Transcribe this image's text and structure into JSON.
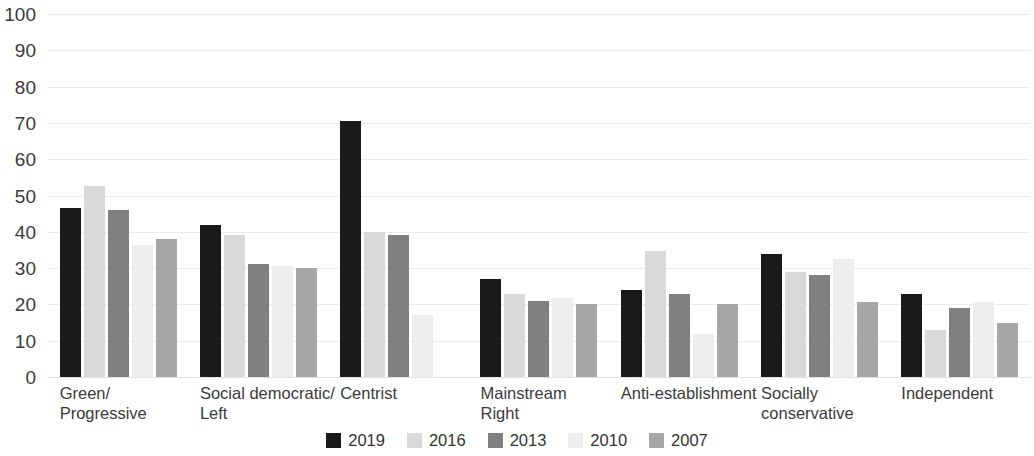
{
  "chart_data": {
    "type": "bar",
    "title": "",
    "subtitle": "",
    "xlabel": "",
    "ylabel": "",
    "ylim": [
      0,
      100
    ],
    "ytick_step": 10,
    "yticks": [
      "100",
      "90",
      "80",
      "70",
      "60",
      "50",
      "40",
      "30",
      "20",
      "10",
      "0"
    ],
    "grid": true,
    "legend_position": "bottom",
    "categories": [
      "Green/\nProgressive",
      "Social democratic/\nLeft",
      "Centrist",
      "Mainstream\nRight",
      "Anti-establishment",
      "Socially\nconservative",
      "Independent"
    ],
    "series": [
      {
        "name": "2019",
        "color": "#1a1a1a",
        "values": [
          46.5,
          42.0,
          70.5,
          27.0,
          24.0,
          33.8,
          23.0
        ]
      },
      {
        "name": "2016",
        "color": "#d9d9d9",
        "values": [
          52.5,
          39.0,
          40.0,
          23.0,
          34.8,
          29.0,
          13.0
        ]
      },
      {
        "name": "2013",
        "color": "#808080",
        "values": [
          46.0,
          31.0,
          39.0,
          21.0,
          23.0,
          28.0,
          19.0
        ]
      },
      {
        "name": "2010",
        "color": "#ededed",
        "values": [
          36.5,
          30.5,
          17.0,
          21.8,
          11.8,
          32.5,
          20.8
        ]
      },
      {
        "name": "2007",
        "color": "#a6a6a6",
        "values": [
          38.0,
          30.0,
          null,
          20.2,
          20.2,
          20.8,
          15.0
        ]
      }
    ]
  },
  "legend": {
    "items": [
      {
        "label": "2019",
        "color": "#1a1a1a"
      },
      {
        "label": "2016",
        "color": "#d9d9d9"
      },
      {
        "label": "2013",
        "color": "#808080"
      },
      {
        "label": "2010",
        "color": "#ededed"
      },
      {
        "label": "2007",
        "color": "#a6a6a6"
      }
    ]
  }
}
